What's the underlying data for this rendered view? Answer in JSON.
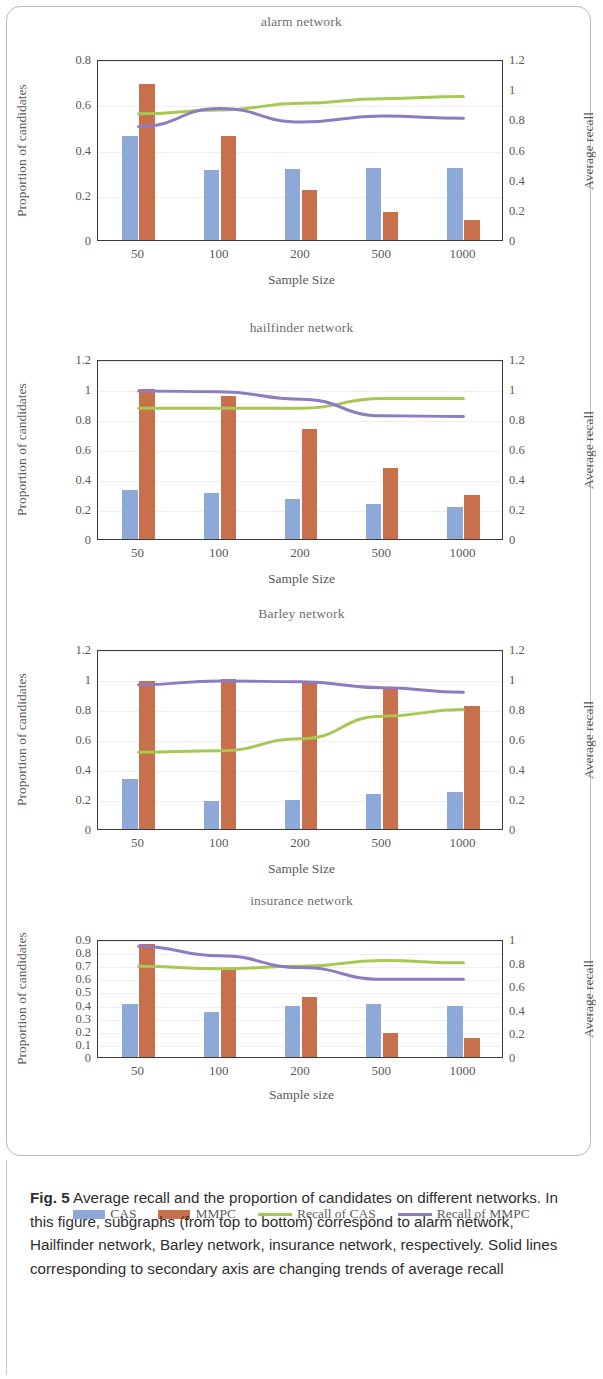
{
  "figure": {
    "caption_label": "Fig. 5",
    "caption_text": "Average recall and the proportion of candidates on different networks. In this figure, subgraphs (from top to bottom) correspond to alarm network, Hailfinder network, Barley network, insurance network, respectively. Solid lines corresponding to secondary axis are changing trends of average recall"
  },
  "legend": {
    "items": [
      {
        "label": "CAS",
        "type": "bar",
        "color": "#8ea9d8"
      },
      {
        "label": "MMPC",
        "type": "bar",
        "color": "#c86f4c"
      },
      {
        "label": "Recall of CAS",
        "type": "line",
        "color": "#a7c954"
      },
      {
        "label": "Recall of MMPC",
        "type": "line",
        "color": "#8d7cc0"
      }
    ]
  },
  "colors": {
    "cas_bar": "#8ea9d8",
    "mmpc_bar": "#c86f4c",
    "recall_cas_line": "#a7c954",
    "recall_mmpc_line": "#8d7cc0",
    "axis": "#3b3b3b",
    "text": "#5a5a5a"
  },
  "chart_data": [
    {
      "type": "bar",
      "title": "alarm network",
      "xlabel": "Sample Size",
      "ylabel": "Proportion of  candidates",
      "y2label": "Average recall",
      "categories": [
        "50",
        "100",
        "200",
        "500",
        "1000"
      ],
      "ylim": [
        0,
        0.8
      ],
      "yticks": [
        "0",
        "0.2",
        "0.4",
        "0.6",
        "0.8"
      ],
      "ytick_values": [
        0,
        0.2,
        0.4,
        0.6,
        0.8
      ],
      "y2lim": [
        0,
        1.2
      ],
      "y2ticks": [
        "0",
        "0.2",
        "0.4",
        "0.6",
        "0.8",
        "1",
        "1.2"
      ],
      "y2tick_values": [
        0,
        0.2,
        0.4,
        0.6,
        0.8,
        1.0,
        1.2
      ],
      "grid": false,
      "legend_position": "bottom",
      "series": [
        {
          "name": "CAS",
          "kind": "bar",
          "axis": "left",
          "values": [
            0.46,
            0.31,
            0.315,
            0.32,
            0.32
          ]
        },
        {
          "name": "MMPC",
          "kind": "bar",
          "axis": "left",
          "values": [
            0.69,
            0.46,
            0.22,
            0.125,
            0.09
          ]
        },
        {
          "name": "Recall of CAS",
          "kind": "line",
          "axis": "right",
          "values": [
            0.85,
            0.875,
            0.92,
            0.95,
            0.965
          ]
        },
        {
          "name": "Recall of MMPC",
          "kind": "line",
          "axis": "right",
          "values": [
            0.765,
            0.885,
            0.795,
            0.835,
            0.82
          ]
        }
      ]
    },
    {
      "type": "bar",
      "title": "hailfinder network",
      "xlabel": "Sample Size",
      "ylabel": "Proportion of  candidates",
      "y2label": "Average recall",
      "categories": [
        "50",
        "100",
        "200",
        "500",
        "1000"
      ],
      "ylim": [
        0,
        1.2
      ],
      "yticks": [
        "0",
        "0.2",
        "0.4",
        "0.6",
        "0.8",
        "1",
        "1.2"
      ],
      "ytick_values": [
        0,
        0.2,
        0.4,
        0.6,
        0.8,
        1.0,
        1.2
      ],
      "y2lim": [
        0,
        1.2
      ],
      "y2ticks": [
        "0",
        "0.2",
        "0.4",
        "0.6",
        "0.8",
        "1",
        "1.2"
      ],
      "y2tick_values": [
        0,
        0.2,
        0.4,
        0.6,
        0.8,
        1.0,
        1.2
      ],
      "grid": false,
      "legend_position": "bottom",
      "series": [
        {
          "name": "CAS",
          "kind": "bar",
          "axis": "left",
          "values": [
            0.325,
            0.31,
            0.265,
            0.235,
            0.215
          ]
        },
        {
          "name": "MMPC",
          "kind": "bar",
          "axis": "left",
          "values": [
            1.0,
            0.955,
            0.735,
            0.475,
            0.295
          ]
        },
        {
          "name": "Recall of CAS",
          "kind": "line",
          "axis": "right",
          "values": [
            0.885,
            0.885,
            0.885,
            0.95,
            0.95
          ]
        },
        {
          "name": "Recall of MMPC",
          "kind": "line",
          "axis": "right",
          "values": [
            1.0,
            0.995,
            0.945,
            0.835,
            0.83
          ]
        }
      ]
    },
    {
      "type": "bar",
      "title": "Barley network",
      "xlabel": "Sample Size",
      "ylabel": "Proportion of candidates",
      "y2label": "Average recall",
      "categories": [
        "50",
        "100",
        "200",
        "500",
        "1000"
      ],
      "ylim": [
        0,
        1.2
      ],
      "yticks": [
        "0",
        "0.2",
        "0.4",
        "0.6",
        "0.8",
        "1",
        "1.2"
      ],
      "ytick_values": [
        0,
        0.2,
        0.4,
        0.6,
        0.8,
        1.0,
        1.2
      ],
      "y2lim": [
        0,
        1.2
      ],
      "y2ticks": [
        "0",
        "0.2",
        "0.4",
        "0.6",
        "0.8",
        "1",
        "1.2"
      ],
      "y2tick_values": [
        0,
        0.2,
        0.4,
        0.6,
        0.8,
        1.0,
        1.2
      ],
      "grid": false,
      "legend_position": "bottom",
      "series": [
        {
          "name": "CAS",
          "kind": "bar",
          "axis": "left",
          "values": [
            0.335,
            0.185,
            0.195,
            0.235,
            0.25
          ]
        },
        {
          "name": "MMPC",
          "kind": "bar",
          "axis": "left",
          "values": [
            0.985,
            1.0,
            0.985,
            0.945,
            0.82
          ]
        },
        {
          "name": "Recall of CAS",
          "kind": "line",
          "axis": "right",
          "values": [
            0.525,
            0.535,
            0.615,
            0.765,
            0.81
          ]
        },
        {
          "name": "Recall of MMPC",
          "kind": "line",
          "axis": "right",
          "values": [
            0.975,
            1.0,
            0.995,
            0.955,
            0.925
          ]
        }
      ]
    },
    {
      "type": "bar",
      "title": "insurance network",
      "xlabel": "Sample size",
      "ylabel": "Proportion of  candidates",
      "y2label": "Average recall",
      "categories": [
        "50",
        "100",
        "200",
        "500",
        "1000"
      ],
      "ylim": [
        0,
        0.9
      ],
      "yticks": [
        "0",
        "0.1",
        "0.2",
        "0.3",
        "0.4",
        "0.5",
        "0.6",
        "0.7",
        "0.8",
        "0.9"
      ],
      "ytick_values": [
        0,
        0.1,
        0.2,
        0.3,
        0.4,
        0.5,
        0.6,
        0.7,
        0.8,
        0.9
      ],
      "y2lim": [
        0,
        1.0
      ],
      "y2ticks": [
        "0",
        "0.2",
        "0.4",
        "0.6",
        "0.8",
        "1"
      ],
      "y2tick_values": [
        0,
        0.2,
        0.4,
        0.6,
        0.8,
        1.0
      ],
      "grid": false,
      "legend_position": "bottom",
      "series": [
        {
          "name": "CAS",
          "kind": "bar",
          "axis": "left",
          "values": [
            0.405,
            0.345,
            0.39,
            0.405,
            0.39
          ]
        },
        {
          "name": "MMPC",
          "kind": "bar",
          "axis": "left",
          "values": [
            0.865,
            0.665,
            0.455,
            0.18,
            0.145
          ]
        },
        {
          "name": "Recall of CAS",
          "kind": "line",
          "axis": "right",
          "values": [
            0.785,
            0.765,
            0.785,
            0.835,
            0.815
          ]
        },
        {
          "name": "Recall of MMPC",
          "kind": "line",
          "axis": "right",
          "values": [
            0.955,
            0.875,
            0.775,
            0.675,
            0.675
          ]
        }
      ]
    }
  ]
}
